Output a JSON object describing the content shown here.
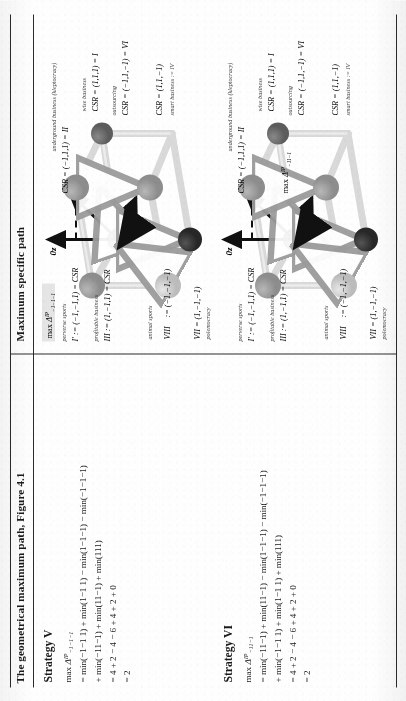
{
  "table": {
    "columns": [
      {
        "id": "left",
        "header": "The geometrical maximum path, Figure 4.1"
      },
      {
        "id": "right",
        "header": "Maximum specific path"
      }
    ]
  },
  "strategies": [
    {
      "id": "strategy-v",
      "title": "Strategy V",
      "objective_prefix": "max ",
      "objective_symbol": "Δ",
      "objective_sup": "IP",
      "objective_sub": "−1−1−1",
      "lines": [
        "= min(−1−1 1) + min(1−1 1) − min(1−1−1) − min(−1−1−1)",
        "+ min(−11−1) + min(11−1) + min(111)",
        "= 4 + 2 − 4 − 6 + 4 + 2 + 0",
        "= 2"
      ]
    },
    {
      "id": "strategy-vi",
      "title": "Strategy VI",
      "objective_prefix": "max ",
      "objective_symbol": "Δ",
      "objective_sup": "IP",
      "objective_sub": "−11−1",
      "lines": [
        "= min(−11−1) + min(11−1) − min(1−1−1) − min(−1−1−1)",
        "+ min(−1−1 1) + min(1−1 1) + min(111)",
        "= 4 + 2 − 4 − 6 + 4 + 2 + 0",
        "= 2"
      ]
    }
  ],
  "diagrams": [
    {
      "id": "diagram-top",
      "axes": [
        {
          "name": "axis-0z",
          "label": "0z"
        },
        {
          "name": "axis-0y",
          "label": "0y"
        },
        {
          "name": "axis-0x",
          "label": "0x"
        }
      ],
      "objective": {
        "prefix": "max ",
        "symbol": "Δ",
        "sup": "IP",
        "sub": "−1−1−1",
        "shaded": true
      },
      "vertices": [
        {
          "name": "vertex-I",
          "caption": "wise\nbusiness",
          "formula": "CSR = (1,1,1) = I",
          "roman": "I",
          "bar": false,
          "tone": "mid"
        },
        {
          "name": "vertex-II",
          "caption": "underground business\n(kleptocracy)",
          "formula": "CSR = (−1,1,1) = II",
          "roman": "II",
          "bar": true,
          "tone": "mid"
        },
        {
          "name": "vertex-VI",
          "caption": "outsourcing",
          "formula": "CSR = (−1,1,−1) = VI",
          "roman": "VI",
          "bar": true,
          "tone": "dark"
        },
        {
          "name": "vertex-IV",
          "caption": "smart\nbusiness",
          "formula": "CSR = (1,1,−1) = IV",
          "roman": "IV",
          "bar": true,
          "tone": "mid"
        },
        {
          "name": "vertex-I-prime",
          "caption": "perverse sports",
          "formula": "I' = (−1,−1,1) = CSR",
          "roman": "I'",
          "bar": true,
          "tone": "light"
        },
        {
          "name": "vertex-III",
          "caption": "profitable business",
          "formula": "III = (1,−1,1) = CSR",
          "roman": "III",
          "bar": true,
          "tone": "mid"
        },
        {
          "name": "vertex-VIII",
          "caption": "animal\nsports",
          "formula": "VIII = (−1,−1,−1) = CSR",
          "roman": "VIII",
          "bar": true,
          "tone": "darkest"
        },
        {
          "name": "vertex-VII",
          "caption": "polemocracy",
          "formula": "VII = (1,−1,−1) = CSR",
          "roman": "VII",
          "bar": true,
          "tone": "mid"
        }
      ]
    },
    {
      "id": "diagram-bottom",
      "axes": [
        {
          "name": "axis-0z",
          "label": "0z"
        },
        {
          "name": "axis-0y",
          "label": "0y"
        },
        {
          "name": "axis-0x",
          "label": "0x"
        }
      ],
      "objective": {
        "prefix": "max ",
        "symbol": "Δ",
        "sup": "IP",
        "sub": "−11−1",
        "shaded": false
      },
      "vertices": [
        {
          "name": "vertex-I",
          "caption": "wise\nbusiness",
          "formula": "CSR = (1,1,1) = I",
          "roman": "I",
          "bar": false,
          "tone": "mid"
        },
        {
          "name": "vertex-II",
          "caption": "underground business\n(kleptocracy)",
          "formula": "CSR = (−1,1,1) = II",
          "roman": "II",
          "bar": true,
          "tone": "mid"
        },
        {
          "name": "vertex-VI",
          "caption": "outsourcing",
          "formula": "CSR = (−1,1,−1) = VI",
          "roman": "VI",
          "bar": true,
          "tone": "dark"
        },
        {
          "name": "vertex-IV",
          "caption": "smart\nbusiness",
          "formula": "CSR = (1,1,−1) = IV",
          "roman": "IV",
          "bar": true,
          "tone": "mid"
        },
        {
          "name": "vertex-I-prime",
          "caption": "perverse sports",
          "formula": "I' = (−1,−1,1) = CSR",
          "roman": "I'",
          "bar": true,
          "tone": "light"
        },
        {
          "name": "vertex-III",
          "caption": "profitable business",
          "formula": "III = (1,−1,1) = CSR",
          "roman": "III",
          "bar": true,
          "tone": "mid"
        },
        {
          "name": "vertex-VIII",
          "caption": "animal\nsports",
          "formula": "VIII = (−1,−1,−1) = CSR",
          "roman": "VIII",
          "bar": true,
          "tone": "darkest"
        },
        {
          "name": "vertex-VII",
          "caption": "polemocracy",
          "formula": "VII = (1,−1,−1) = CSR",
          "roman": "VII",
          "bar": true,
          "tone": "mid"
        }
      ]
    }
  ],
  "colors": {
    "rule": "#2b2b2b",
    "text": "#1a1a1a",
    "node_light": "#c9c9c9",
    "node_mid": "#9a9a9a",
    "node_dark": "#6e6e6e",
    "node_darkest": "#3a3a3a",
    "edge": "#d5d5d5",
    "arrow": "#111111"
  },
  "labels": {
    "axis_z": "0z",
    "axis_y": "0y",
    "axis_x": "0x",
    "d1_v_I": "CSR = (1,1,1) = I",
    "d1_v_I_cap": "wise business",
    "d1_v_II": "CSR = (−1,1,1) = II",
    "d1_v_II_cap": "underground business (kleptocracy)",
    "d1_v_VI": "CSR = (−1,1,−1) = VI",
    "d1_v_VI_cap": "outsourcing",
    "d1_v_IV": "CSR = (1,1,−1)",
    "d1_v_IV_cap": "smart business := IV",
    "d1_v_Ip": "I' := (−1,−1,1) = CSR",
    "d1_v_Ip_cap": "perverse sports",
    "d1_v_III": "III := (1,−1,1) = CSR",
    "d1_v_III_cap": "profitable business",
    "d1_v_VIII": "VIII",
    "d1_v_VIII_b": ":= (−1,−1,−1)",
    "d1_v_VIII_cap": "animal sports",
    "d1_v_VII": "VII = (1,−1,−1)",
    "d1_v_VII_cap": "polemocracy"
  }
}
